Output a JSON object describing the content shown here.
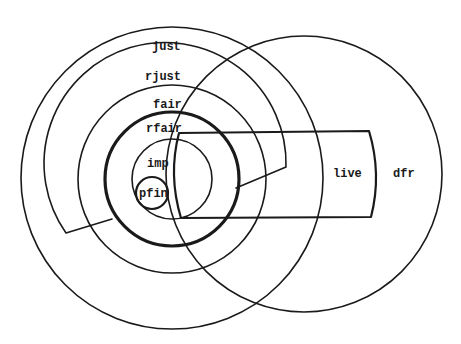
{
  "diagram": {
    "type": "set-inclusion diagram (concentric sets with overlapping circle)",
    "colors": {
      "ink": "#1a1a1a",
      "background": "#ffffff"
    },
    "labels": {
      "just": "just",
      "rjust": "rjust",
      "fair": "fair",
      "rfair": "rfair",
      "imp": "imp",
      "pfin": "pfin",
      "live": "live",
      "dfr": "dfr"
    },
    "sets": [
      {
        "id": "just",
        "shape": "circle",
        "label": "just"
      },
      {
        "id": "rjust",
        "shape": "notched region",
        "label": "rjust"
      },
      {
        "id": "fair",
        "shape": "circle",
        "label": "fair"
      },
      {
        "id": "rfair",
        "shape": "circle (thick)",
        "label": "rfair"
      },
      {
        "id": "imp",
        "shape": "circle",
        "label": "imp"
      },
      {
        "id": "pfin",
        "shape": "small circle",
        "label": "pfin"
      },
      {
        "id": "live",
        "shape": "band",
        "label": "live"
      },
      {
        "id": "dfr",
        "shape": "circle",
        "label": "dfr"
      }
    ]
  }
}
